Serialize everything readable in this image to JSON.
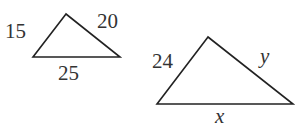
{
  "figure": {
    "small_triangle": {
      "sides": {
        "left": "15",
        "right": "20",
        "base": "25"
      },
      "vertices": [
        [
          66,
          14
        ],
        [
          33,
          57
        ],
        [
          120,
          57
        ]
      ]
    },
    "large_triangle": {
      "sides": {
        "left": "24",
        "right": "y",
        "base": "x"
      },
      "vertices": [
        [
          208,
          37
        ],
        [
          157,
          104
        ],
        [
          293,
          104
        ]
      ]
    },
    "colors": {
      "stroke": "#222222",
      "text": "#333333",
      "background": "#ffffff"
    }
  }
}
